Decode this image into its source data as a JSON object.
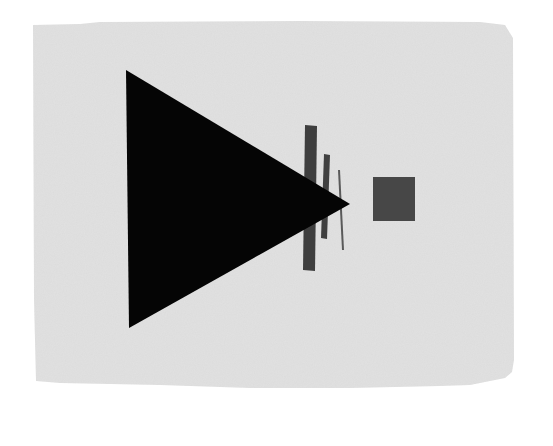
{
  "artwork": {
    "description": "Suprematist composition: large black triangle pointing right, three vertical bars, and a gray square on aged paper",
    "background_color": "#ffffff",
    "paper": {
      "color": "#e2e2e2",
      "noise_color": "#d2d2d2",
      "points": "33,25 80,24 100,22 300,21 480,22 505,25 513,38 514,360 512,372 505,378 490,381 470,385 440,386 350,388 250,388 160,385 60,383 36,381 34,300"
    },
    "triangle": {
      "color": "#050505",
      "points": "126,70 350,204 129,328"
    },
    "bars": [
      {
        "name": "wide-bar",
        "color": "#3e3e3e",
        "points": "305,125 317,126 315,271 303,270"
      },
      {
        "name": "medium-bar",
        "color": "#404040",
        "points": "324,154 330,155 327,239 321,238"
      },
      {
        "name": "thin-bar",
        "color": "#5a5a5a",
        "points": "338,170 340,170 344,250 342,250"
      }
    ],
    "square": {
      "color": "#474747",
      "x": 373,
      "y": 177,
      "width": 42,
      "height": 44
    }
  }
}
